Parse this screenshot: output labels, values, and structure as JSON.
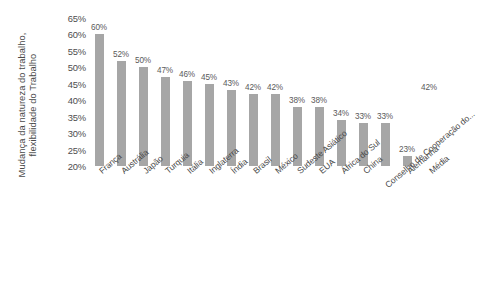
{
  "chart_data": {
    "type": "bar",
    "title": "",
    "subtitle": "",
    "xlabel": "",
    "ylabel": "Mudança da natureza do trabalho, flexibilidade do Trabalho",
    "ylabel_lines": [
      "Mudança da natureza do trabalho,",
      "flexibilidade do Trabalho"
    ],
    "ylim": [
      20,
      65
    ],
    "ytick_labels": [
      "65%",
      "60%",
      "55%",
      "50%",
      "45%",
      "40%",
      "35%",
      "30%",
      "25%",
      "20%"
    ],
    "ytick_values": [
      65,
      60,
      55,
      50,
      45,
      40,
      35,
      30,
      25,
      20
    ],
    "grid": false,
    "legend": null,
    "bar_color": "#a6a6a6",
    "categories": [
      "França",
      "Austrália",
      "Japão",
      "Turquia",
      "Itália",
      "Inglaterra",
      "Índia",
      "Brasil",
      "México",
      "Sudeste Asiático",
      "EUA",
      "África do Sul",
      "China",
      "Conselho de Cooperação do...",
      "Alemanha",
      "Média"
    ],
    "values": [
      60,
      52,
      50,
      47,
      46,
      45,
      43,
      42,
      42,
      38,
      38,
      34,
      33,
      33,
      23,
      42
    ],
    "data_labels": [
      "60%",
      "52%",
      "50%",
      "47%",
      "46%",
      "45%",
      "43%",
      "42%",
      "42%",
      "38%",
      "38%",
      "34%",
      "33%",
      "33%",
      "23%",
      "42%"
    ],
    "bar_rendered": [
      true,
      true,
      true,
      true,
      true,
      true,
      true,
      true,
      true,
      true,
      true,
      true,
      true,
      true,
      true,
      false
    ]
  }
}
